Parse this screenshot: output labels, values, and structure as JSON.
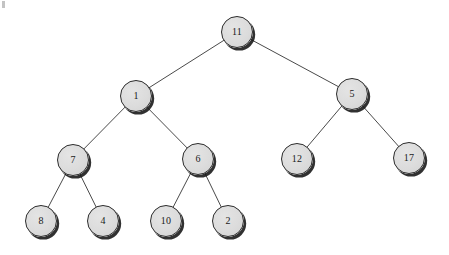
{
  "figure": {
    "kind": "binary-tree-diagram",
    "width": 449,
    "height": 255,
    "background_color": "#ffffff"
  },
  "style": {
    "node_fill": "#dcdcdc",
    "node_border": "#2b2b2b",
    "node_text_color": "#1a1a1a",
    "edge_color": "#4a4a4a",
    "shadow_color": "#141414",
    "node_diameter": 32,
    "edge_width": 1
  },
  "tree": {
    "root_id": "n11",
    "levels": 4,
    "nodes": [
      {
        "id": "n11",
        "label": "11",
        "cx": 237,
        "cy": 32,
        "r": 16,
        "level": 0,
        "parent": null
      },
      {
        "id": "n1",
        "label": "1",
        "cx": 136,
        "cy": 96,
        "r": 16,
        "level": 1,
        "parent": "n11"
      },
      {
        "id": "n5",
        "label": "5",
        "cx": 352,
        "cy": 94,
        "r": 16,
        "level": 1,
        "parent": "n11"
      },
      {
        "id": "n7",
        "label": "7",
        "cx": 73,
        "cy": 160,
        "r": 16,
        "level": 2,
        "parent": "n1"
      },
      {
        "id": "n6",
        "label": "6",
        "cx": 198,
        "cy": 159,
        "r": 16,
        "level": 2,
        "parent": "n1"
      },
      {
        "id": "n12",
        "label": "12",
        "cx": 297,
        "cy": 159,
        "r": 16,
        "level": 2,
        "parent": "n5"
      },
      {
        "id": "n17",
        "label": "17",
        "cx": 409,
        "cy": 158,
        "r": 16,
        "level": 2,
        "parent": "n5"
      },
      {
        "id": "n8",
        "label": "8",
        "cx": 41,
        "cy": 221,
        "r": 16,
        "level": 3,
        "parent": "n7"
      },
      {
        "id": "n4",
        "label": "4",
        "cx": 103,
        "cy": 221,
        "r": 16,
        "level": 3,
        "parent": "n7"
      },
      {
        "id": "n10",
        "label": "10",
        "cx": 166,
        "cy": 221,
        "r": 16,
        "level": 3,
        "parent": "n6"
      },
      {
        "id": "n2",
        "label": "2",
        "cx": 228,
        "cy": 221,
        "r": 16,
        "level": 3,
        "parent": "n6"
      }
    ],
    "edges": [
      {
        "from": "n11",
        "to": "n1",
        "x1": 237,
        "y1": 32,
        "x2": 136,
        "y2": 96
      },
      {
        "from": "n11",
        "to": "n5",
        "x1": 237,
        "y1": 32,
        "x2": 352,
        "y2": 94
      },
      {
        "from": "n1",
        "to": "n7",
        "x1": 136,
        "y1": 96,
        "x2": 73,
        "y2": 160
      },
      {
        "from": "n1",
        "to": "n6",
        "x1": 136,
        "y1": 96,
        "x2": 198,
        "y2": 159
      },
      {
        "from": "n5",
        "to": "n12",
        "x1": 352,
        "y1": 94,
        "x2": 297,
        "y2": 159
      },
      {
        "from": "n5",
        "to": "n17",
        "x1": 352,
        "y1": 94,
        "x2": 409,
        "y2": 158
      },
      {
        "from": "n7",
        "to": "n8",
        "x1": 73,
        "y1": 160,
        "x2": 41,
        "y2": 221
      },
      {
        "from": "n7",
        "to": "n4",
        "x1": 73,
        "y1": 160,
        "x2": 103,
        "y2": 221
      },
      {
        "from": "n6",
        "to": "n10",
        "x1": 198,
        "y1": 159,
        "x2": 166,
        "y2": 221
      },
      {
        "from": "n6",
        "to": "n2",
        "x1": 198,
        "y1": 159,
        "x2": 228,
        "y2": 221
      }
    ]
  },
  "artifacts": [
    {
      "id": "speck-corner",
      "x": 2,
      "y": 1,
      "w": 3,
      "h": 7
    }
  ]
}
